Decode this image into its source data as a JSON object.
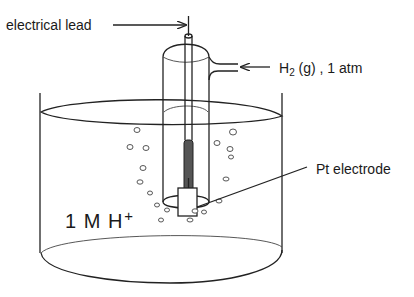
{
  "diagram": {
    "type": "standard hydrogen electrode",
    "labels": {
      "electrical_lead": "electrical lead",
      "gas_main": "H",
      "gas_sub": "2",
      "gas_rest": " (g) ,  1 atm",
      "electrode": "Pt electrode",
      "solution_main": "1 M H",
      "solution_sup": "+"
    },
    "colors": {
      "line": "#222222",
      "background": "#ffffff",
      "electrode_fill": "#555555"
    }
  }
}
